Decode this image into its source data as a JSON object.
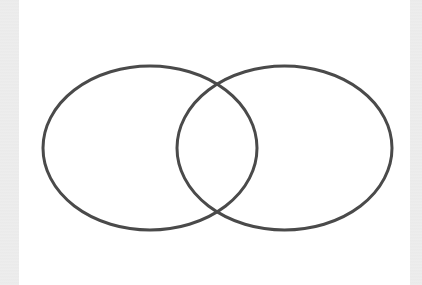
{
  "diagram": {
    "type": "venn",
    "sets": [
      {
        "name": "left-set",
        "cx": 150,
        "cy": 148,
        "rx": 107,
        "ry": 82
      },
      {
        "name": "right-set",
        "cx": 284.5,
        "cy": 148,
        "rx": 107.5,
        "ry": 82
      }
    ],
    "stroke_color": "#4a4a4a",
    "stroke_width": 3,
    "fill": "none",
    "background": "#ffffff",
    "labels": []
  }
}
